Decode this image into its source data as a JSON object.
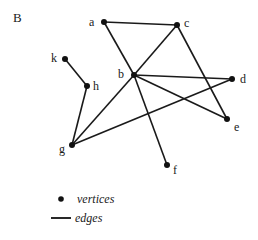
{
  "panel_label": "B",
  "graph": {
    "vertices": [
      {
        "id": "a",
        "x": 104,
        "y": 22,
        "lx": 89,
        "ly": 16
      },
      {
        "id": "c",
        "x": 177,
        "y": 25,
        "lx": 184,
        "ly": 17
      },
      {
        "id": "b",
        "x": 134,
        "y": 75,
        "lx": 118,
        "ly": 68
      },
      {
        "id": "d",
        "x": 232,
        "y": 79,
        "lx": 240,
        "ly": 73
      },
      {
        "id": "e",
        "x": 227,
        "y": 119,
        "lx": 234,
        "ly": 121
      },
      {
        "id": "f",
        "x": 167,
        "y": 165,
        "lx": 173,
        "ly": 164
      },
      {
        "id": "k",
        "x": 65,
        "y": 59,
        "lx": 51,
        "ly": 52
      },
      {
        "id": "h",
        "x": 87,
        "y": 86,
        "lx": 93,
        "ly": 80
      },
      {
        "id": "g",
        "x": 72,
        "y": 145,
        "lx": 59,
        "ly": 143
      }
    ],
    "edges": [
      [
        "a",
        "c"
      ],
      [
        "a",
        "b"
      ],
      [
        "c",
        "b"
      ],
      [
        "c",
        "e"
      ],
      [
        "b",
        "d"
      ],
      [
        "b",
        "e"
      ],
      [
        "b",
        "f"
      ],
      [
        "b",
        "g"
      ],
      [
        "g",
        "d"
      ],
      [
        "g",
        "h"
      ],
      [
        "h",
        "k"
      ]
    ]
  },
  "legend": {
    "vertices_label": "vertices",
    "edges_label": "edges"
  }
}
